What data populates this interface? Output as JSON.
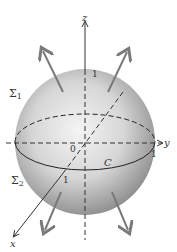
{
  "diagram": {
    "type": "sphere-surface-orientation",
    "labels": {
      "z_axis": "z",
      "y_axis": "y",
      "x_axis": "x",
      "origin": "0",
      "upper_hemisphere": "Σ",
      "upper_hemisphere_sub": "1",
      "lower_hemisphere": "Σ",
      "lower_hemisphere_sub": "2",
      "curve": "C",
      "z_intercept": "1",
      "y_intercept": "1",
      "x_intercept": "1"
    },
    "colors": {
      "sphere_light": "#f2f2f2",
      "sphere_dark": "#9a9a9a",
      "lines": "#333333",
      "arrows": "#777777"
    }
  }
}
